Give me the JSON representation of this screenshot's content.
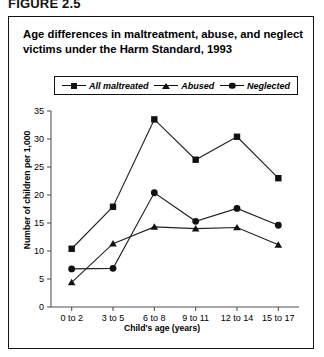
{
  "figure": {
    "number": "FIGURE 2.5",
    "title": "Age differences in maltreatment, abuse, and neglect victims under the Harm Standard, 1993"
  },
  "legend": {
    "position": "top-center",
    "entries": [
      {
        "label": "All maltreated",
        "marker": "square-marker-icon"
      },
      {
        "label": "Abused",
        "marker": "triangle-marker-icon"
      },
      {
        "label": "Neglected",
        "marker": "circle-marker-icon"
      }
    ]
  },
  "chart_data": {
    "type": "line",
    "title": "Age differences in maltreatment, abuse, and neglect victims under the Harm Standard, 1993",
    "xlabel": "Child's age (years)",
    "ylabel": "Number of children per 1,000",
    "categories": [
      "0 to 2",
      "3 to 5",
      "6 to 8",
      "9 to 11",
      "12 to 14",
      "15 to 17"
    ],
    "series": [
      {
        "name": "All maltreated",
        "marker": "square",
        "values": [
          10.4,
          17.9,
          33.5,
          26.3,
          30.4,
          23.0
        ]
      },
      {
        "name": "Neglected",
        "marker": "circle",
        "values": [
          6.8,
          6.9,
          20.4,
          15.3,
          17.6,
          14.6
        ]
      },
      {
        "name": "Abused",
        "marker": "triangle",
        "values": [
          4.4,
          11.3,
          14.3,
          14.0,
          14.2,
          11.1
        ]
      }
    ],
    "ylim": [
      0,
      35
    ],
    "yticks": [
      0,
      5,
      10,
      15,
      20,
      25,
      30,
      35
    ],
    "ytick_labels": [
      "0",
      "5",
      "10",
      "15",
      "20",
      "25",
      "30",
      "35"
    ],
    "grid": false,
    "legend_position": "top-center"
  }
}
